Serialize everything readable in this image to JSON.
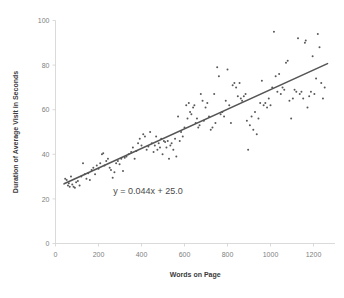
{
  "chart_data": {
    "type": "scatter",
    "title": "",
    "xlabel": "Words on Page",
    "ylabel": "Duration of Average Visit in Seconds",
    "xlim": [
      0,
      1300
    ],
    "ylim": [
      0,
      100
    ],
    "xticks": [
      0,
      200,
      400,
      600,
      800,
      1000,
      1200
    ],
    "yticks": [
      0,
      20,
      40,
      60,
      80,
      100
    ],
    "grid": false,
    "legend": null,
    "annotations": [
      {
        "text": "y = 0.044x + 25.0",
        "x": 430,
        "y": 22
      }
    ],
    "trendline": {
      "type": "linear",
      "slope": 0.044,
      "intercept": 25.0,
      "equation": "y = 0.044x + 25.0",
      "x_start": 40,
      "x_end": 1265,
      "color": "#555555"
    },
    "marker_color": "#595959",
    "axis_color": "#d0d0d0",
    "series": [
      {
        "name": "Pages",
        "points": [
          [
            45,
            29
          ],
          [
            52,
            28.5
          ],
          [
            58,
            26
          ],
          [
            62,
            27
          ],
          [
            66,
            25.5
          ],
          [
            72,
            30
          ],
          [
            78,
            26.5
          ],
          [
            84,
            25.5
          ],
          [
            90,
            25
          ],
          [
            96,
            27.5
          ],
          [
            104,
            28
          ],
          [
            112,
            26
          ],
          [
            120,
            30
          ],
          [
            128,
            36
          ],
          [
            136,
            31
          ],
          [
            144,
            29
          ],
          [
            152,
            31.5
          ],
          [
            160,
            28.5
          ],
          [
            168,
            33
          ],
          [
            176,
            34
          ],
          [
            184,
            31
          ],
          [
            192,
            35
          ],
          [
            200,
            33.5
          ],
          [
            208,
            36
          ],
          [
            216,
            40
          ],
          [
            222,
            40.5
          ],
          [
            228,
            35
          ],
          [
            236,
            37
          ],
          [
            244,
            38
          ],
          [
            252,
            34
          ],
          [
            258,
            33
          ],
          [
            266,
            29.5
          ],
          [
            274,
            32
          ],
          [
            282,
            36
          ],
          [
            290,
            37
          ],
          [
            298,
            35.5
          ],
          [
            306,
            38
          ],
          [
            314,
            32.5
          ],
          [
            322,
            38.5
          ],
          [
            330,
            39
          ],
          [
            340,
            40
          ],
          [
            352,
            41
          ],
          [
            360,
            43
          ],
          [
            368,
            38
          ],
          [
            376,
            41.5
          ],
          [
            384,
            45
          ],
          [
            392,
            47
          ],
          [
            400,
            44
          ],
          [
            408,
            49
          ],
          [
            416,
            48
          ],
          [
            424,
            42
          ],
          [
            432,
            43.5
          ],
          [
            440,
            50
          ],
          [
            448,
            45
          ],
          [
            456,
            41
          ],
          [
            462,
            44
          ],
          [
            468,
            48
          ],
          [
            474,
            42
          ],
          [
            480,
            45
          ],
          [
            486,
            43
          ],
          [
            492,
            47
          ],
          [
            498,
            40
          ],
          [
            504,
            46
          ],
          [
            510,
            45.5
          ],
          [
            516,
            43
          ],
          [
            522,
            46
          ],
          [
            528,
            38
          ],
          [
            534,
            44
          ],
          [
            540,
            45
          ],
          [
            548,
            42
          ],
          [
            556,
            47
          ],
          [
            562,
            39
          ],
          [
            570,
            57
          ],
          [
            578,
            46
          ],
          [
            584,
            50
          ],
          [
            592,
            48
          ],
          [
            600,
            52
          ],
          [
            608,
            62
          ],
          [
            614,
            56
          ],
          [
            620,
            63
          ],
          [
            626,
            59
          ],
          [
            632,
            58
          ],
          [
            640,
            61
          ],
          [
            646,
            62
          ],
          [
            652,
            54
          ],
          [
            658,
            56
          ],
          [
            664,
            52
          ],
          [
            670,
            53
          ],
          [
            676,
            67
          ],
          [
            684,
            64
          ],
          [
            690,
            55
          ],
          [
            698,
            61
          ],
          [
            706,
            63
          ],
          [
            714,
            57
          ],
          [
            722,
            51
          ],
          [
            730,
            52
          ],
          [
            738,
            67
          ],
          [
            744,
            54
          ],
          [
            752,
            79
          ],
          [
            760,
            75
          ],
          [
            768,
            58
          ],
          [
            776,
            59
          ],
          [
            784,
            57
          ],
          [
            792,
            64
          ],
          [
            800,
            78
          ],
          [
            808,
            62
          ],
          [
            816,
            54
          ],
          [
            824,
            71
          ],
          [
            832,
            72
          ],
          [
            840,
            70
          ],
          [
            848,
            66
          ],
          [
            856,
            72
          ],
          [
            862,
            65
          ],
          [
            868,
            64
          ],
          [
            876,
            66
          ],
          [
            884,
            67
          ],
          [
            890,
            55
          ],
          [
            896,
            42
          ],
          [
            904,
            53
          ],
          [
            912,
            57
          ],
          [
            920,
            51
          ],
          [
            928,
            59
          ],
          [
            936,
            49
          ],
          [
            944,
            56
          ],
          [
            952,
            63
          ],
          [
            960,
            73
          ],
          [
            968,
            62
          ],
          [
            976,
            63
          ],
          [
            984,
            61
          ],
          [
            992,
            65
          ],
          [
            1000,
            62
          ],
          [
            1008,
            70
          ],
          [
            1016,
            95
          ],
          [
            1024,
            75
          ],
          [
            1032,
            68
          ],
          [
            1040,
            76
          ],
          [
            1048,
            67
          ],
          [
            1056,
            70
          ],
          [
            1064,
            69
          ],
          [
            1072,
            81
          ],
          [
            1080,
            82
          ],
          [
            1088,
            64
          ],
          [
            1096,
            56
          ],
          [
            1104,
            65
          ],
          [
            1112,
            69
          ],
          [
            1120,
            68
          ],
          [
            1128,
            92
          ],
          [
            1136,
            67
          ],
          [
            1144,
            68
          ],
          [
            1152,
            65
          ],
          [
            1160,
            90
          ],
          [
            1164,
            91
          ],
          [
            1172,
            61
          ],
          [
            1180,
            66
          ],
          [
            1188,
            68
          ],
          [
            1196,
            84
          ],
          [
            1204,
            67
          ],
          [
            1212,
            74
          ],
          [
            1220,
            94
          ],
          [
            1228,
            88
          ],
          [
            1236,
            72
          ],
          [
            1244,
            65
          ],
          [
            1252,
            70
          ]
        ]
      }
    ]
  }
}
